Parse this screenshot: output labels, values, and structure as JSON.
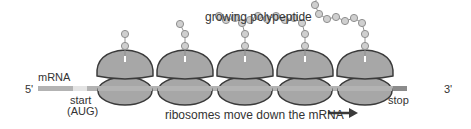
{
  "diagram": {
    "title": "growing polypeptide",
    "labels": {
      "five_prime": "5'",
      "three_prime": "3'",
      "mrna": "mRNA",
      "start": "start",
      "start_codon": "(AUG)",
      "stop": "stop",
      "caption": "ribosomes move down the mRNA"
    },
    "colors": {
      "ribosome_fill": "#a7a7a7",
      "ribosome_stroke": "#3a3a3a",
      "mrna": "#b3b3b3",
      "start_region": "#e4e4e4",
      "stop_region": "#8c8c8c",
      "bead_fill": "#cfcfcf",
      "bead_stroke": "#8f8f8f",
      "arrow": "#3a3a3a",
      "text": "#333333"
    },
    "ribosomes": [
      {
        "id": 1,
        "cx": 125,
        "chain_length": 2
      },
      {
        "id": 2,
        "cx": 185,
        "chain_length": 3
      },
      {
        "id": 3,
        "cx": 245,
        "chain_length": 6
      },
      {
        "id": 4,
        "cx": 305,
        "chain_length": 9
      },
      {
        "id": 5,
        "cx": 365,
        "chain_length": 12
      }
    ]
  }
}
